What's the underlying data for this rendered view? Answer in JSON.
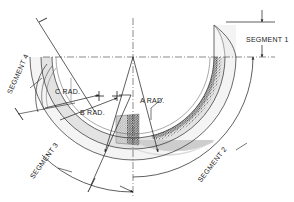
{
  "drawing": {
    "type": "engineering-section-diagram",
    "background_color": "#ffffff",
    "line_color": "#1a1a1a",
    "centerline_color": "#4d4d4d",
    "fill_light": "#f2f2f2",
    "fill_mid": "#d9d9d9",
    "fill_shade": "#c9c9c9",
    "texture_color": "#3a3a3a"
  },
  "labels": {
    "segment_1": "SEGMENT 1",
    "segment_2": "SEGMENT 2",
    "segment_3": "SEGMENT 3",
    "segment_4": "SEGMENT 4",
    "a_rad": "A RAD.",
    "b_rad": "B RAD.",
    "c_rad": "C RAD."
  },
  "icons": {
    "arrowhead": "arrowhead-icon",
    "tick_terminator": "slash-tick-icon",
    "centerline": "dash-dot-centerline-icon",
    "granular_fill": "granular-texture-icon"
  }
}
